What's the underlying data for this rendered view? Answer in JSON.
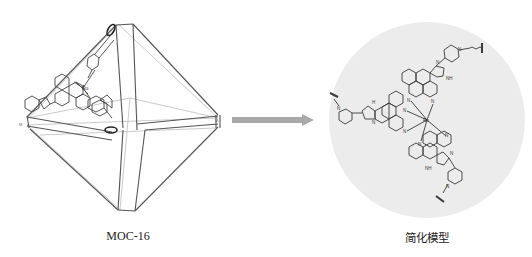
{
  "figure": {
    "left_panel": {
      "caption": "MOC-16",
      "description": "Octahedral metal-organic cage crystal structure with one Ru tris-ligand vertex drawn",
      "center_atom": "Ru",
      "vertex_label": "M"
    },
    "arrow": {
      "direction": "right",
      "color": "#a9a9a9"
    },
    "right_panel": {
      "caption": "简化模型",
      "background_circle_color": "#ececec",
      "center_atom": "Ru",
      "atom_labels": {
        "nitrogen": "N",
        "imidazole_nh": "NH",
        "hydrogen": "H",
        "metal_link": "M"
      }
    },
    "colors": {
      "line_dark": "#3a3a3a",
      "line_light": "#9a9a9a",
      "text": "#222222"
    }
  }
}
